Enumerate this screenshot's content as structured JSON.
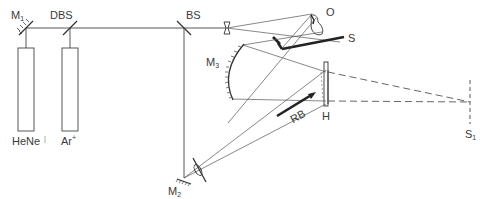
{
  "diagram": {
    "type": "holographic-interferometry-optical-setup",
    "labels": {
      "mirror1": "M",
      "mirror1_sub": "1",
      "dichroic": "DBS",
      "beamsplitter": "BS",
      "object": "O",
      "screen": "S",
      "mirror3": "M",
      "mirror3_sub": "3",
      "reference_beam": "RB",
      "hologram": "H",
      "mirror2": "M",
      "mirror2_sub": "2",
      "image_plane": "S",
      "image_plane_sub": "1",
      "laser_hene": "HeNe",
      "laser_argon": "Ar",
      "laser_argon_sup": "+"
    },
    "components": [
      {
        "id": "M1",
        "kind": "mirror",
        "x": 26,
        "y": 28
      },
      {
        "id": "DBS",
        "kind": "dichroic-beamsplitter",
        "x": 70,
        "y": 28
      },
      {
        "id": "BS",
        "kind": "beamsplitter",
        "x": 184,
        "y": 28
      },
      {
        "id": "lens1",
        "kind": "diverging-lens",
        "x": 227,
        "y": 28
      },
      {
        "id": "O",
        "kind": "object",
        "x": 316,
        "y": 30
      },
      {
        "id": "S",
        "kind": "screen",
        "x": 340,
        "y": 38
      },
      {
        "id": "M3",
        "kind": "concave-mirror",
        "x": 236,
        "y": 80
      },
      {
        "id": "H",
        "kind": "hologram-plate",
        "x": 326,
        "y": 90
      },
      {
        "id": "RB",
        "kind": "reference-beam-arrow",
        "x": 302,
        "y": 112
      },
      {
        "id": "M2",
        "kind": "mirror",
        "x": 184,
        "y": 178
      },
      {
        "id": "lens2",
        "kind": "diverging-lens",
        "x": 196,
        "y": 168
      },
      {
        "id": "S1",
        "kind": "image-plane",
        "x": 470,
        "y": 102
      },
      {
        "id": "HeNe",
        "kind": "laser",
        "x": 26,
        "y": 90
      },
      {
        "id": "Ar+",
        "kind": "laser",
        "x": 70,
        "y": 90
      }
    ]
  }
}
